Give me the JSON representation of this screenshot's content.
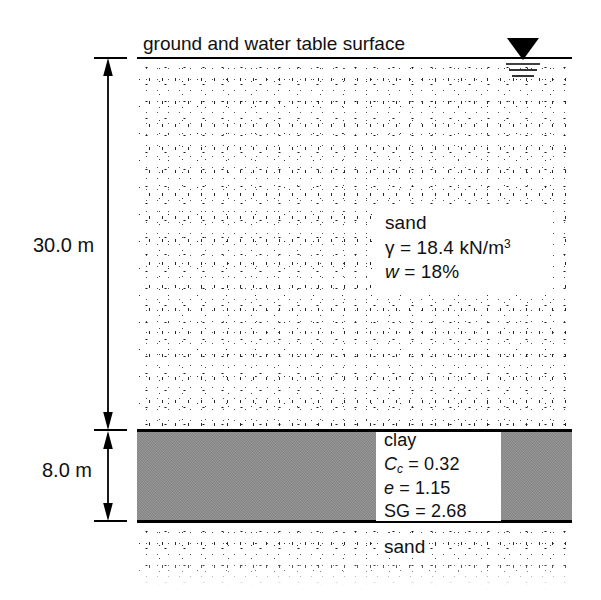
{
  "figure": {
    "type": "soil-profile-cross-section",
    "surface_caption": "ground and water table surface",
    "water_table_symbol": "inverted-filled-triangle-with-three-lines"
  },
  "dimensions": [
    {
      "id": "upper-sand-thickness",
      "label": "30.0 m",
      "value": 30.0,
      "unit": "m"
    },
    {
      "id": "clay-thickness",
      "label": "8.0 m",
      "value": 8.0,
      "unit": "m"
    }
  ],
  "layers": [
    {
      "id": "upper-sand",
      "name": "sand",
      "fill": "stipple",
      "properties": [
        {
          "symbol": "γ",
          "equals": "=",
          "value": "18.4",
          "unit": "kN/m",
          "exponent": "3"
        },
        {
          "symbol": "w",
          "equals": "=",
          "value": "18%",
          "unit": "",
          "exponent": ""
        }
      ]
    },
    {
      "id": "clay",
      "name": "clay",
      "fill": "solid-gray",
      "properties": [
        {
          "symbol": "C",
          "subscript": "c",
          "equals": "=",
          "value": "0.32"
        },
        {
          "symbol": "e",
          "subscript": "",
          "equals": "=",
          "value": "1.15"
        },
        {
          "symbol": "SG",
          "subscript": "",
          "equals": "=",
          "value": "2.68"
        }
      ]
    },
    {
      "id": "lower-sand",
      "name": "sand",
      "fill": "stipple",
      "properties": []
    }
  ],
  "colors": {
    "line": "#000000",
    "clay_fill": "#8a8a8a",
    "background": "#ffffff",
    "text": "#111111"
  }
}
